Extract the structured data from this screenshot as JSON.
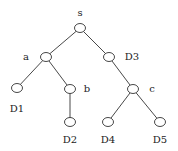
{
  "diagram": {
    "type": "tree",
    "nodes": [
      {
        "id": "s",
        "label": "s",
        "x": 80,
        "y": 28,
        "lx": 80,
        "ly": 16
      },
      {
        "id": "a",
        "label": "a",
        "x": 46,
        "y": 57,
        "lx": 26,
        "ly": 60
      },
      {
        "id": "D3",
        "label": "D3",
        "x": 109,
        "y": 57,
        "lx": 132,
        "ly": 60
      },
      {
        "id": "D1",
        "label": "D1",
        "x": 17,
        "y": 88,
        "lx": 17,
        "ly": 112
      },
      {
        "id": "b",
        "label": "b",
        "x": 70,
        "y": 89,
        "lx": 87,
        "ly": 92
      },
      {
        "id": "c",
        "label": "c",
        "x": 133,
        "y": 89,
        "lx": 152,
        "ly": 92
      },
      {
        "id": "D2",
        "label": "D2",
        "x": 70,
        "y": 122,
        "lx": 70,
        "ly": 143
      },
      {
        "id": "D4",
        "label": "D4",
        "x": 108,
        "y": 122,
        "lx": 108,
        "ly": 143
      },
      {
        "id": "D5",
        "label": "D5",
        "x": 160,
        "y": 122,
        "lx": 160,
        "ly": 143
      }
    ],
    "edges": [
      [
        "s",
        "a"
      ],
      [
        "s",
        "D3"
      ],
      [
        "a",
        "D1"
      ],
      [
        "a",
        "b"
      ],
      [
        "b",
        "D2"
      ],
      [
        "D3",
        "c"
      ],
      [
        "c",
        "D4"
      ],
      [
        "c",
        "D5"
      ]
    ]
  }
}
